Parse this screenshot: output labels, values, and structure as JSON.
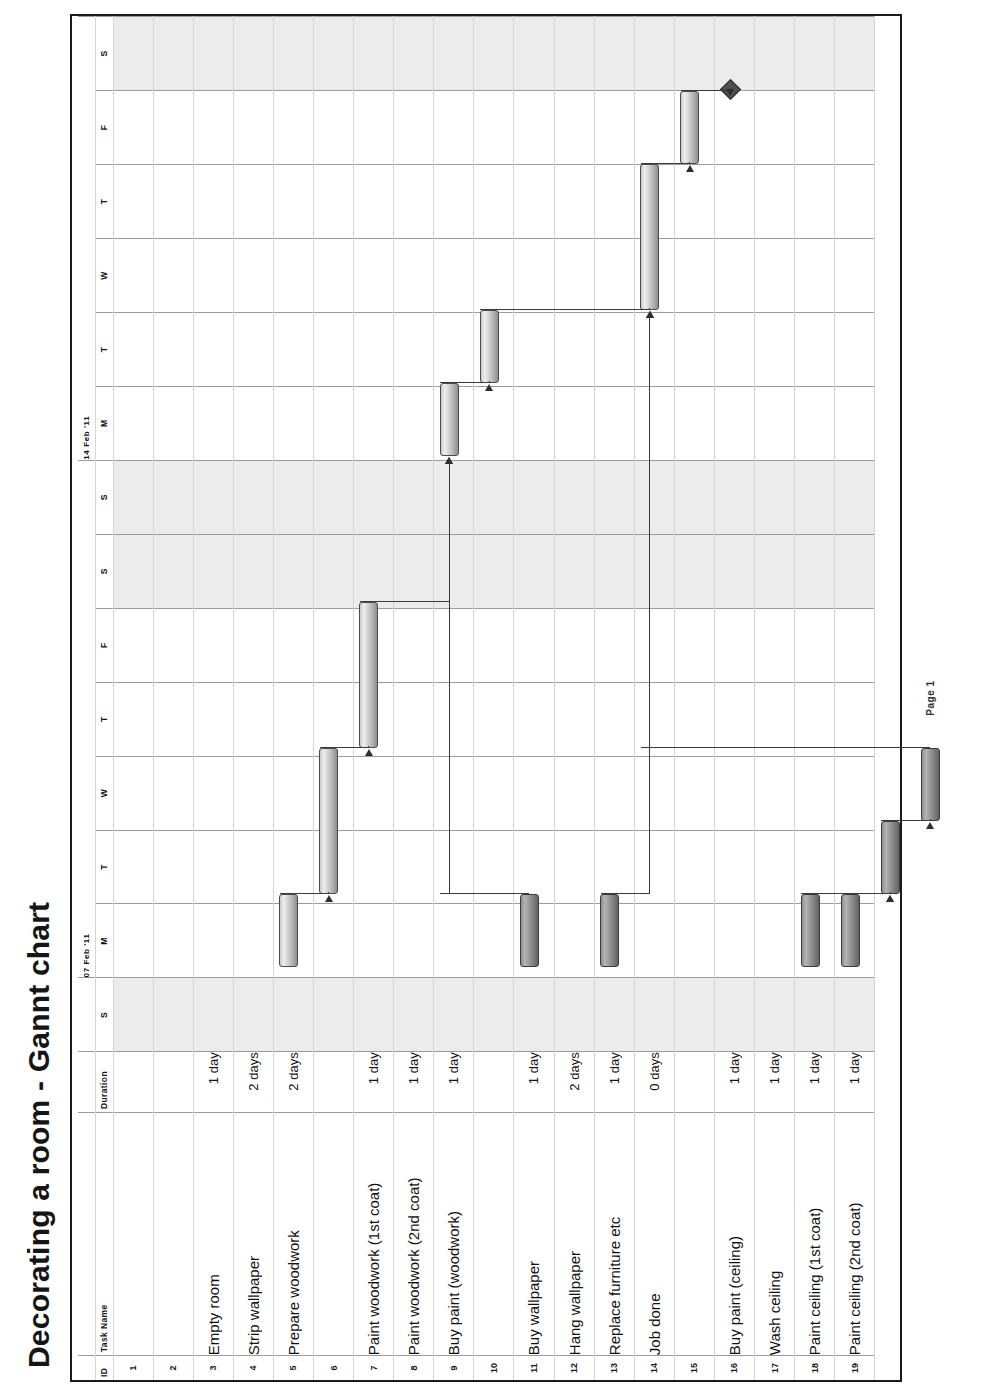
{
  "document": {
    "title": "Decorating a room - Gannt chart",
    "footer": "Page 1"
  },
  "columns": {
    "id": "ID",
    "task_name": "Task Name",
    "duration": "Duration"
  },
  "timeline": {
    "weeks": [
      {
        "label": "07 Feb '11",
        "days": [
          "S",
          "M",
          "T",
          "W",
          "T",
          "F",
          "S",
          "S"
        ]
      },
      {
        "label": "14 Feb '11",
        "days": [
          "M",
          "T",
          "W",
          "T",
          "F",
          "S"
        ]
      }
    ],
    "weekend_days": [
      "S"
    ]
  },
  "rows": [
    {
      "id": "1",
      "task": "",
      "duration": ""
    },
    {
      "id": "2",
      "task": "",
      "duration": ""
    },
    {
      "id": "3",
      "task": "Empty room",
      "duration": "1 day"
    },
    {
      "id": "4",
      "task": "Strip wallpaper",
      "duration": "2 days"
    },
    {
      "id": "5",
      "task": "Prepare woodwork",
      "duration": "2 days"
    },
    {
      "id": "6",
      "task": "",
      "duration": ""
    },
    {
      "id": "7",
      "task": "Paint woodwork (1st coat)",
      "duration": "1 day"
    },
    {
      "id": "8",
      "task": "Paint woodwork (2nd coat)",
      "duration": "1 day"
    },
    {
      "id": "9",
      "task": "Buy paint (woodwork)",
      "duration": "1 day"
    },
    {
      "id": "10",
      "task": "",
      "duration": ""
    },
    {
      "id": "11",
      "task": "Buy wallpaper",
      "duration": "1 day"
    },
    {
      "id": "12",
      "task": "Hang wallpaper",
      "duration": "2 days"
    },
    {
      "id": "13",
      "task": "Replace furniture etc",
      "duration": "1 day"
    },
    {
      "id": "14",
      "task": "Job done",
      "duration": "0 days"
    },
    {
      "id": "15",
      "task": "",
      "duration": ""
    },
    {
      "id": "16",
      "task": "Buy paint (ceiling)",
      "duration": "1 day"
    },
    {
      "id": "17",
      "task": "Wash ceiling",
      "duration": "1 day"
    },
    {
      "id": "18",
      "task": "Paint ceiling (1st coat)",
      "duration": "1 day"
    },
    {
      "id": "19",
      "task": "Paint ceiling (2nd coat)",
      "duration": "1 day"
    }
  ],
  "chart_data": {
    "type": "bar",
    "title": "Decorating a room - Gannt chart",
    "xlabel": "",
    "ylabel": "",
    "categories": [
      "Empty room",
      "Strip wallpaper",
      "Prepare woodwork",
      "Paint woodwork (1st coat)",
      "Paint woodwork (2nd coat)",
      "Buy paint (woodwork)",
      "Buy wallpaper",
      "Hang wallpaper",
      "Replace furniture etc",
      "Job done",
      "Buy paint (ceiling)",
      "Wash ceiling",
      "Paint ceiling (1st coat)",
      "Paint ceiling (2nd coat)"
    ],
    "axis_days": [
      "S",
      "M",
      "T",
      "W",
      "T",
      "F",
      "S",
      "S",
      "M",
      "T",
      "W",
      "T",
      "F",
      "S"
    ],
    "axis_weeks": [
      "07 Feb '11",
      "14 Feb '11"
    ],
    "bars": [
      {
        "id": "3",
        "task": "Empty room",
        "start_day": 1,
        "length_days": 1,
        "style": "light"
      },
      {
        "id": "4",
        "task": "Strip wallpaper",
        "start_day": 2,
        "length_days": 2,
        "style": "light"
      },
      {
        "id": "5",
        "task": "Prepare woodwork",
        "start_day": 4,
        "length_days": 2,
        "style": "light"
      },
      {
        "id": "7",
        "task": "Paint woodwork (1st coat)",
        "start_day": 8,
        "length_days": 1,
        "style": "light"
      },
      {
        "id": "8",
        "task": "Paint woodwork (2nd coat)",
        "start_day": 9,
        "length_days": 1,
        "style": "light"
      },
      {
        "id": "9",
        "task": "Buy paint (woodwork)",
        "start_day": 1,
        "length_days": 1,
        "style": "dark"
      },
      {
        "id": "11",
        "task": "Buy wallpaper",
        "start_day": 1,
        "length_days": 1,
        "style": "dark"
      },
      {
        "id": "12",
        "task": "Hang wallpaper",
        "start_day": 10,
        "length_days": 2,
        "style": "light"
      },
      {
        "id": "13",
        "task": "Replace furniture etc",
        "start_day": 12,
        "length_days": 1,
        "style": "light"
      },
      {
        "id": "14",
        "task": "Job done",
        "start_day": 13,
        "length_days": 0,
        "style": "milestone"
      },
      {
        "id": "16",
        "task": "Buy paint (ceiling)",
        "start_day": 1,
        "length_days": 1,
        "style": "dark"
      },
      {
        "id": "17",
        "task": "Wash ceiling",
        "start_day": 1,
        "length_days": 1,
        "style": "dark"
      },
      {
        "id": "18",
        "task": "Paint ceiling (1st coat)",
        "start_day": 2,
        "length_days": 1,
        "style": "dark"
      },
      {
        "id": "19",
        "task": "Paint ceiling (2nd coat)",
        "start_day": 3,
        "length_days": 1,
        "style": "dark"
      }
    ],
    "dependencies": [
      {
        "from": "3",
        "to": "4"
      },
      {
        "from": "4",
        "to": "5"
      },
      {
        "from": "5",
        "to": "7"
      },
      {
        "from": "9",
        "to": "7"
      },
      {
        "from": "7",
        "to": "8"
      },
      {
        "from": "8",
        "to": "12"
      },
      {
        "from": "11",
        "to": "12"
      },
      {
        "from": "19",
        "to": "12"
      },
      {
        "from": "12",
        "to": "13"
      },
      {
        "from": "13",
        "to": "14"
      },
      {
        "from": "16",
        "to": "18"
      },
      {
        "from": "17",
        "to": "18"
      },
      {
        "from": "18",
        "to": "19"
      }
    ]
  }
}
